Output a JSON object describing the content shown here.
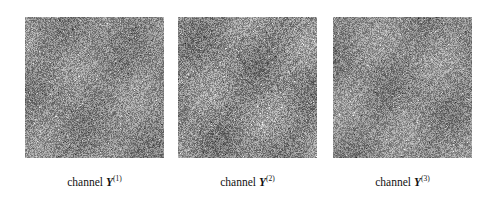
{
  "figure": {
    "background_color": "#ffffff",
    "panel_count": 3,
    "panels": [
      {
        "id": "channel-1",
        "caption_prefix": "channel",
        "symbol": "Y",
        "superscript": "(1)",
        "caption_full": "channel Y(1)",
        "base_gray": "#8b8b8b",
        "noise_seed": 1,
        "noise_amplitude": 44,
        "structure_strength": 9
      },
      {
        "id": "channel-2",
        "caption_prefix": "channel",
        "symbol": "Y",
        "superscript": "(2)",
        "caption_full": "channel Y(2)",
        "base_gray": "#8a8a8a",
        "noise_seed": 2,
        "noise_amplitude": 46,
        "structure_strength": 12
      },
      {
        "id": "channel-3",
        "caption_prefix": "channel",
        "symbol": "Y",
        "superscript": "(3)",
        "caption_full": "channel Y(3)",
        "base_gray": "#8c8c8c",
        "noise_seed": 3,
        "noise_amplitude": 43,
        "structure_strength": 10
      }
    ]
  }
}
